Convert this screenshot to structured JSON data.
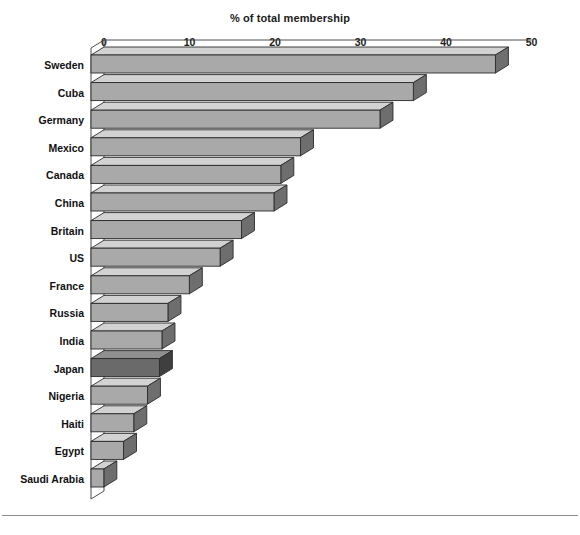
{
  "chart_data": {
    "type": "bar",
    "orientation": "horizontal",
    "style": "3d",
    "title": "% of total membership",
    "xlabel": "",
    "ylabel": "",
    "xlim": [
      0,
      50
    ],
    "xticks": [
      0,
      10,
      20,
      30,
      40,
      50
    ],
    "xtick_labels": [
      "0",
      "10",
      "20",
      "30",
      "40",
      "50"
    ],
    "grid": false,
    "legend": null,
    "categories": [
      "Sweden",
      "Cuba",
      "Germany",
      "Mexico",
      "Canada",
      "China",
      "Britain",
      "US",
      "France",
      "Russia",
      "India",
      "Japan",
      "Nigeria",
      "Haiti",
      "Egypt",
      "Saudi Arabia"
    ],
    "values": [
      47.3,
      37.7,
      33.8,
      24.5,
      22.2,
      21.4,
      17.6,
      15.1,
      11.5,
      9.0,
      8.3,
      8.0,
      6.6,
      5.0,
      3.8,
      1.5
    ],
    "highlight_index": 11,
    "highlight_category": "Japan",
    "series": [
      {
        "name": "% of total membership",
        "values": [
          47.3,
          37.7,
          33.8,
          24.5,
          22.2,
          21.4,
          17.6,
          15.1,
          11.5,
          9.0,
          8.3,
          8.0,
          6.6,
          5.0,
          3.8,
          1.5
        ]
      }
    ]
  },
  "colors": {
    "bar_face": "#a9a9a9",
    "bar_top": "#d2d2d2",
    "bar_side": "#6e6e6e",
    "bar_face_highlight": "#6a6a6a",
    "bar_top_highlight": "#8f8f8f",
    "bar_side_highlight": "#3f3f3f",
    "outline": "#2b2b2b",
    "axis": "#3a3a3a",
    "text": "#111111",
    "background": "#ffffff",
    "footer_rule": "#8d8d8d"
  }
}
